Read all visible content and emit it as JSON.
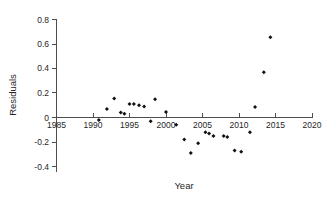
{
  "chart_data": {
    "type": "scatter",
    "title": "",
    "xlabel": "Year",
    "ylabel": "Residuals",
    "xlim": [
      1985,
      2020
    ],
    "ylim": [
      -0.4,
      0.8
    ],
    "xticks": [
      1985,
      1990,
      1995,
      2000,
      2005,
      2010,
      2015,
      2020
    ],
    "xticklabels": [
      "1985",
      "1990",
      "1995",
      "2000",
      "2005",
      "2010",
      "2015",
      "2020"
    ],
    "yticks": [
      -0.4,
      -0.2,
      0,
      0.2,
      0.4,
      0.6,
      0.8
    ],
    "yticklabels": [
      "-0.4",
      "-0.2",
      "0",
      "0.2",
      "0.4",
      "0.6",
      "0.8"
    ],
    "grid": false,
    "legend": null,
    "zero_line": true,
    "marker": "filled-diamond",
    "marker_color": "#111111",
    "axis_color": "#4d4d4d",
    "series": [
      {
        "name": "Residuals",
        "x": [
          1990.8,
          1991.9,
          1992.9,
          1993.8,
          1994.3,
          1995.0,
          1995.6,
          1996.3,
          1997.0,
          1997.9,
          1998.5,
          2000.0,
          2001.4,
          2002.5,
          2003.4,
          2004.4,
          2005.4,
          2005.9,
          2006.5,
          2007.9,
          2008.4,
          2009.4,
          2010.3,
          2011.5,
          2012.2,
          2013.4,
          2014.3
        ],
        "y": [
          -0.02,
          0.07,
          0.155,
          0.04,
          0.03,
          0.11,
          0.11,
          0.1,
          0.09,
          -0.03,
          0.15,
          0.045,
          -0.06,
          -0.18,
          -0.29,
          -0.21,
          -0.12,
          -0.13,
          -0.15,
          -0.15,
          -0.16,
          -0.27,
          -0.28,
          -0.12,
          0.085,
          0.37,
          0.655
        ]
      }
    ]
  }
}
